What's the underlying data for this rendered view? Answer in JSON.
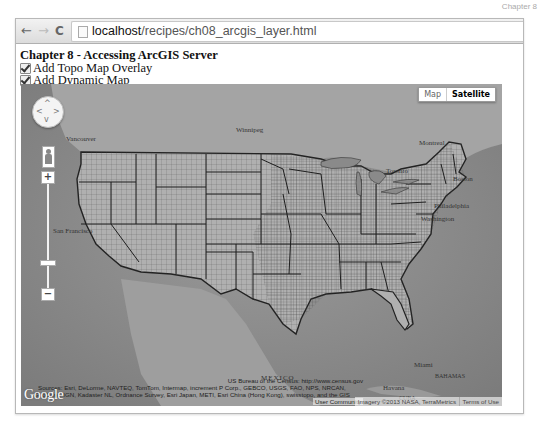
{
  "corner_label": "Chapter 8",
  "browser": {
    "nav": {
      "back": "←",
      "forward": "→",
      "reload": "C"
    },
    "url_host": "localhost",
    "url_path": "/recipes/ch08_arcgis_layer.html"
  },
  "page": {
    "title": "Chapter 8 - Accessing ArcGIS Server",
    "checkboxes": [
      {
        "label": "Add Topo Map Overlay",
        "checked": true
      },
      {
        "label": "Add Dynamic Map",
        "checked": true
      }
    ]
  },
  "map": {
    "map_type": {
      "map_label": "Map",
      "satellite_label": "Satellite",
      "selected": "Satellite"
    },
    "pan": {
      "up": "^",
      "down": "v",
      "left": "<",
      "right": ">"
    },
    "zoom": {
      "in": "+",
      "out": "−"
    },
    "places": [
      {
        "name": "Vancouver",
        "x": 45,
        "y": 51
      },
      {
        "name": "Winnipeg",
        "x": 215,
        "y": 42
      },
      {
        "name": "Montreal",
        "x": 398,
        "y": 55
      },
      {
        "name": "Toronto",
        "x": 365,
        "y": 83
      },
      {
        "name": "Boston",
        "x": 432,
        "y": 91
      },
      {
        "name": "Philadelphia",
        "x": 413,
        "y": 118
      },
      {
        "name": "Washington",
        "x": 400,
        "y": 131
      },
      {
        "name": "San Francisco",
        "x": 32,
        "y": 143
      },
      {
        "name": "MEXICO",
        "x": 240,
        "y": 290
      },
      {
        "name": "Miami",
        "x": 393,
        "y": 277
      },
      {
        "name": "BAHAMAS",
        "x": 414,
        "y": 289
      },
      {
        "name": "Havana",
        "x": 362,
        "y": 300
      },
      {
        "name": "CUBA",
        "x": 378,
        "y": 311
      }
    ],
    "attribution": {
      "line1": "US Bureau of the Census: http://www.census.gov",
      "line2": "Sources: Esri, DeLorme, NAVTEQ, TomTom, Intermap, increment P Corp., GEBCO, USGS, FAO, NPS, NRCAN,",
      "line3": "GeoBase, IGN, Kadaster NL, Ordnance Survey, Esri Japan, METI, Esri China (Hong Kong), swisstopo, and the GIS",
      "line4": "User Community",
      "google": "Google",
      "imagery": "Imagery ©2013 NASA, TerraMetrics",
      "terms": "Terms of Use"
    }
  }
}
